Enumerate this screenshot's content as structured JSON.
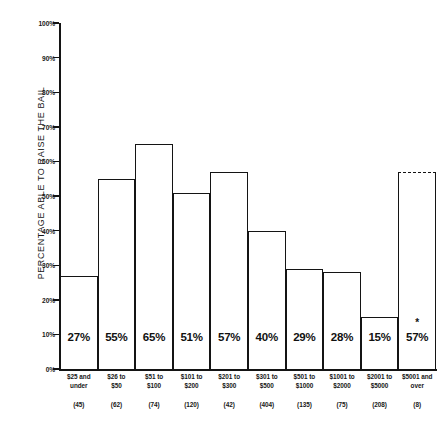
{
  "chart_data": {
    "type": "bar",
    "title": "",
    "subtitle": "",
    "xlabel": "",
    "ylabel": "PERCENTAGE ABLE TO RAISE THE BAIL",
    "ylim": [
      0,
      100
    ],
    "grid": false,
    "legend": "none",
    "y_ticks": [
      "0%",
      "10%",
      "20%",
      "30%",
      "40%",
      "50%",
      "60%",
      "70%",
      "80%",
      "90%",
      "100%"
    ],
    "y_tick_values": [
      0,
      10,
      20,
      30,
      40,
      50,
      60,
      70,
      80,
      90,
      100
    ],
    "categories": [
      "$25 and under",
      "$26 to $50",
      "$51 to $100",
      "$101 to $200",
      "$201 to $300",
      "$301 to $500",
      "$501 to $1000",
      "$1001 to $2000",
      "$2001 to $5000",
      "$5001 and over"
    ],
    "category_lines": [
      [
        "$25 and",
        "under"
      ],
      [
        "$26 to",
        "$50"
      ],
      [
        "$51 to",
        "$100"
      ],
      [
        "$101 to",
        "$200"
      ],
      [
        "$201 to",
        "$300"
      ],
      [
        "$301 to",
        "$500"
      ],
      [
        "$501 to",
        "$1000"
      ],
      [
        "$1001 to",
        "$2000"
      ],
      [
        "$2001 to",
        "$5000"
      ],
      [
        "$5001 and",
        "over"
      ]
    ],
    "values": [
      27,
      55,
      65,
      51,
      57,
      40,
      29,
      28,
      15,
      57
    ],
    "value_labels": [
      "27%",
      "55%",
      "65%",
      "51%",
      "57%",
      "40%",
      "29%",
      "28%",
      "15%",
      "57%"
    ],
    "sample_sizes": [
      45,
      62,
      74,
      120,
      42,
      404,
      135,
      75,
      208,
      8
    ],
    "sample_size_labels": [
      "(45)",
      "(62)",
      "(74)",
      "(120)",
      "(42)",
      "(404)",
      "(135)",
      "(75)",
      "(208)",
      "(8)"
    ],
    "annotations": [
      {
        "category": "$5001 and over",
        "marker": "*",
        "style": "dashed-top-border"
      }
    ],
    "colors": {
      "bar_fill": "#ffffff",
      "bar_outline": "#141414",
      "axis": "#141414",
      "text": "#171717"
    }
  }
}
